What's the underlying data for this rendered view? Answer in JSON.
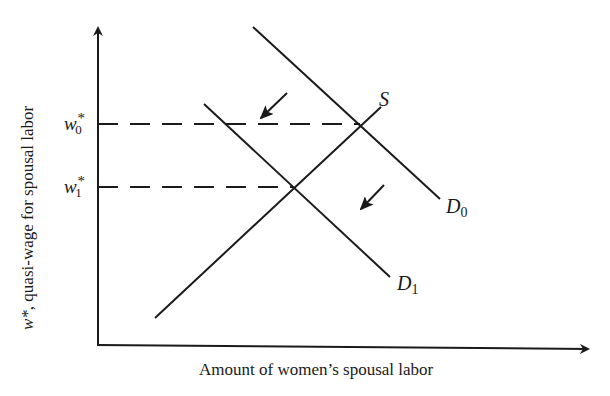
{
  "diagram": {
    "type": "supply-demand",
    "axes": {
      "x_label": "Amount of women’s spousal labor",
      "y_label_var": "w*",
      "y_label_rest": ", quasi-wage for spousal labor"
    },
    "price_levels": [
      {
        "symbol": "w",
        "sub": "0",
        "sup": "*",
        "y": 124
      },
      {
        "symbol": "w",
        "sub": "1",
        "sup": "*",
        "y": 187
      }
    ],
    "curves": [
      {
        "name": "S",
        "label": "S",
        "sub": "",
        "x1": 155,
        "y1": 318,
        "x2": 381,
        "y2": 107
      },
      {
        "name": "D0",
        "label": "D",
        "sub": "0",
        "x1": 253,
        "y1": 27,
        "x2": 440,
        "y2": 199
      },
      {
        "name": "D1",
        "label": "D",
        "sub": "1",
        "x1": 204,
        "y1": 104,
        "x2": 390,
        "y2": 277
      }
    ],
    "equilibria": [
      {
        "name": "E0",
        "x": 360,
        "y": 124
      },
      {
        "name": "E1",
        "x": 293,
        "y": 187
      }
    ],
    "shift_arrows": [
      {
        "from": [
          287,
          93
        ],
        "to": [
          261,
          118
        ]
      },
      {
        "from": [
          384,
          185
        ],
        "to": [
          361,
          209
        ]
      }
    ],
    "shift_description": "Demand shifts left from D0 to D1"
  }
}
